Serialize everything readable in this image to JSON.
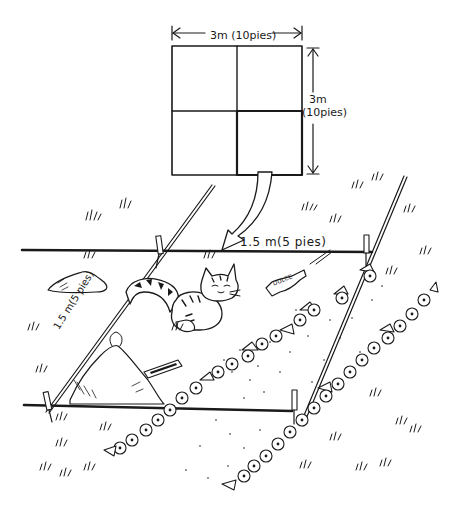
{
  "figure": {
    "colors": {
      "ink": "#1a1a1a",
      "background": "#ffffff"
    }
  },
  "inset_square": {
    "width_label": "3m (10pies)",
    "height_label_line1": "3m",
    "height_label_line2": "(10pies)",
    "divisions": "2x2",
    "highlighted_quadrant": "bottom-right"
  },
  "quadrat": {
    "top_edge_label": "1.5 m(5 pies)",
    "left_edge_label": "1.5 m(5 pies)",
    "stakes": 4
  },
  "scene_objects": {
    "animal": "cat",
    "litter_wrapper_label": "DULCE",
    "litter_items": [
      "candy-wrapper",
      "matchbox"
    ],
    "plants": [
      "flower-rows",
      "grass-tufts",
      "rocks"
    ]
  }
}
